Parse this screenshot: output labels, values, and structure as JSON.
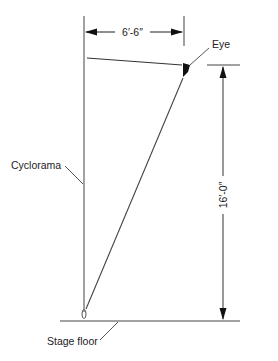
{
  "diagram": {
    "type": "section-sightline",
    "labels": {
      "eye": "Eye",
      "cyclorama": "Cyclorama",
      "stage_floor": "Stage floor"
    },
    "dimensions": {
      "horizontal": "6′-6″",
      "vertical": "16′-0″"
    },
    "colors": {
      "line": "#444444",
      "ink": "#111111",
      "background": "#ffffff"
    }
  }
}
